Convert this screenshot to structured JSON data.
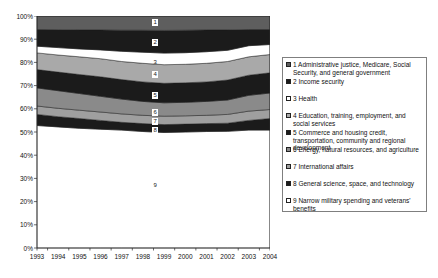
{
  "chart_data": {
    "type": "area",
    "subtype": "100-percent-stacked",
    "title": "",
    "xlabel": "",
    "ylabel": "",
    "ylim": [
      0,
      100
    ],
    "grid": false,
    "legend_position": "right",
    "x": [
      "1993",
      "1994",
      "1995",
      "1996",
      "1997",
      "1998",
      "1999",
      "2000",
      "2001",
      "2002",
      "2003",
      "2004"
    ],
    "y_tick_labels": [
      "0%",
      "10%",
      "20%",
      "30%",
      "40%",
      "50%",
      "60%",
      "70%",
      "80%",
      "90%",
      "100%"
    ],
    "series": [
      {
        "number": "1",
        "label": "Administrative justice, Medicare, Social Security, and general government",
        "color": "#5e5e5e",
        "values": [
          5.8,
          5.9,
          6.0,
          6.0,
          6.1,
          6.1,
          6.2,
          6.1,
          6.0,
          6.0,
          5.8,
          5.8
        ]
      },
      {
        "number": "2",
        "label": "Income security",
        "color": "#1b1b1b",
        "values": [
          7.2,
          7.7,
          8.2,
          8.6,
          9.1,
          9.5,
          9.8,
          9.7,
          9.4,
          8.8,
          7.0,
          6.5
        ]
      },
      {
        "number": "3",
        "label": "Health",
        "color": "#ffffff",
        "values": [
          2.9,
          3.2,
          3.4,
          3.8,
          4.4,
          4.8,
          5.0,
          5.0,
          5.0,
          4.8,
          4.8,
          4.3
        ]
      },
      {
        "number": "4",
        "label": "Education, training, employment, and social services",
        "color": "#a9a9a9",
        "values": [
          7.2,
          7.4,
          7.6,
          7.8,
          7.8,
          8.0,
          8.0,
          8.0,
          8.0,
          8.0,
          7.9,
          7.9
        ]
      },
      {
        "number": "5",
        "label": "Commerce and housing credit, transportation, community and regional development",
        "color": "#1b1b1b",
        "values": [
          7.9,
          8.0,
          8.2,
          8.4,
          8.4,
          8.4,
          8.4,
          8.4,
          8.4,
          8.6,
          8.7,
          8.7
        ]
      },
      {
        "number": "6",
        "label": "Energy, natural resources,  and agriculture",
        "color": "#8a8a8a",
        "values": [
          7.8,
          7.6,
          7.2,
          6.8,
          6.4,
          6.0,
          5.8,
          5.8,
          6.0,
          6.2,
          6.8,
          7.1
        ]
      },
      {
        "number": "7",
        "label": "International affairs",
        "color": "#9f9f9f",
        "values": [
          3.6,
          3.6,
          3.6,
          3.6,
          3.6,
          3.6,
          3.6,
          3.6,
          3.6,
          3.8,
          4.0,
          3.9
        ]
      },
      {
        "number": "8",
        "label": "General science, space, and technology",
        "color": "#1b1b1b",
        "values": [
          4.8,
          4.4,
          4.2,
          3.8,
          3.4,
          3.4,
          3.4,
          3.4,
          3.4,
          3.5,
          4.2,
          5.0
        ]
      },
      {
        "number": "9",
        "label": "Narrow military spending and veterans' benefits",
        "color": "#ffffff",
        "values": [
          52.8,
          52.2,
          51.6,
          51.2,
          50.8,
          50.2,
          49.8,
          50.0,
          50.2,
          50.3,
          50.8,
          50.8
        ]
      }
    ],
    "annotations": [
      {
        "text": "1",
        "x_frac": 0.509,
        "y_pct": 97.4,
        "boxed": true
      },
      {
        "text": "2",
        "x_frac": 0.509,
        "y_pct": 88.5,
        "boxed": true
      },
      {
        "text": "3",
        "x_frac": 0.509,
        "y_pct": 80.1,
        "boxed": false
      },
      {
        "text": "4",
        "x_frac": 0.509,
        "y_pct": 74.9,
        "boxed": true
      },
      {
        "text": "5",
        "x_frac": 0.509,
        "y_pct": 65.9,
        "boxed": true
      },
      {
        "text": "6",
        "x_frac": 0.509,
        "y_pct": 58.5,
        "boxed": true
      },
      {
        "text": "7",
        "x_frac": 0.509,
        "y_pct": 54.4,
        "boxed": true
      },
      {
        "text": "8",
        "x_frac": 0.509,
        "y_pct": 50.7,
        "boxed": true
      },
      {
        "text": "9",
        "x_frac": 0.509,
        "y_pct": 27.0,
        "boxed": false
      }
    ],
    "axis_color": "#2b2b2b",
    "band_outline_color": "#1f1f1f"
  }
}
